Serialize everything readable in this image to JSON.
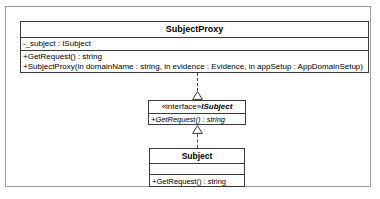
{
  "diagram": {
    "type": "uml-class-diagram",
    "background_color": "#ffffff",
    "frame_color": "#9a9a9a",
    "line_color": "#3a3a3a",
    "classes": [
      {
        "id": "subjectproxy",
        "name": "SubjectProxy",
        "attributes": [
          "-_subject : ISubject"
        ],
        "operations": [
          "+GetRequest() : string",
          "+SubjectProxy(in domainName : string, in evidence : Evidence, in appSetup : AppDomainSetup)"
        ]
      },
      {
        "id": "isubject",
        "stereotype": "«interface»",
        "name": "ISubject",
        "attributes": [],
        "operations": [
          "+GetRequest() : string"
        ]
      },
      {
        "id": "subject",
        "name": "Subject",
        "attributes": [],
        "operations": [
          "+GetRequest() : string"
        ]
      }
    ],
    "relationships": [
      {
        "id": "proxy-isubject",
        "kind": "realization",
        "source": "SubjectProxy",
        "target": "ISubject",
        "line_style": "dashed",
        "arrowhead": "hollow-triangle"
      },
      {
        "id": "subject-isubject",
        "kind": "realization",
        "source": "Subject",
        "target": "ISubject",
        "line_style": "dashed",
        "arrowhead": "hollow-triangle"
      }
    ]
  }
}
